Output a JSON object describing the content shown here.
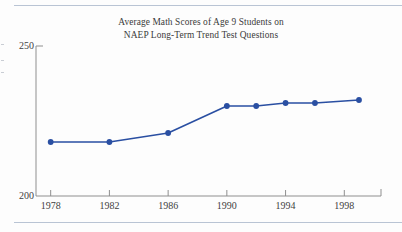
{
  "page": {
    "background_color": "#fdfdfd",
    "rule_color": "#b9c4d4"
  },
  "chart_data": {
    "type": "line",
    "title": "Average Math Scores of Age 9 Students on NAEP Long-Term Trend Test Questions",
    "title_lines": [
      "Average Math Scores of Age 9 Students on",
      "NAEP Long-Term Trend Test Questions"
    ],
    "xlabel": "",
    "ylabel": "",
    "x": [
      1978,
      1982,
      1986,
      1990,
      1992,
      1994,
      1996,
      1999
    ],
    "values": [
      218,
      218,
      221,
      230,
      230,
      231,
      231,
      232
    ],
    "series": [
      {
        "name": "Average math score, age 9",
        "values": [
          218,
          218,
          221,
          230,
          230,
          231,
          231,
          232
        ]
      }
    ],
    "xlim": [
      1977,
      2000.5
    ],
    "ylim": [
      200,
      250
    ],
    "y_tick_labels": [
      "200",
      "250"
    ],
    "y_ticks": [
      200,
      250
    ],
    "x_tick_labels": [
      "1978",
      "1982",
      "1986",
      "1990",
      "1994",
      "1998"
    ],
    "x_ticks": [
      1978,
      1982,
      1986,
      1990,
      1994,
      1998
    ],
    "grid": false,
    "legend": false,
    "legend_position": "none",
    "line_color": "#2a4fa2",
    "marker": "circle",
    "marker_color": "#2a4fa2",
    "axis_color": "#8f8f8f"
  }
}
